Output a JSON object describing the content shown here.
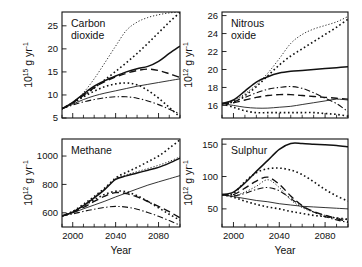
{
  "figure": {
    "shared_xlabel": "Year",
    "xticks": [
      2000,
      2040,
      2080
    ],
    "xtick_labels": [
      "2000",
      "2040",
      "2080"
    ],
    "xlim": [
      1990,
      2100
    ],
    "xminor_step": 10
  },
  "chart_data": [
    {
      "id": "carbon-dioxide",
      "type": "line",
      "title": "Carbon dioxide",
      "title_line1": "Carbon",
      "title_line2": "dioxide",
      "xlabel": "",
      "ylabel": "10¹⁵ g yr⁻¹",
      "ylabel_mantissa": "10",
      "ylabel_exponent": "15",
      "ylabel_unit": "g yr",
      "ylabel_unit_exponent": "-1",
      "xlim": [
        1990,
        2100
      ],
      "ylim": [
        5,
        28
      ],
      "yticks": [
        5,
        10,
        15,
        20,
        25
      ],
      "ytick_labels": [
        "5",
        "10",
        "15",
        "20",
        "25"
      ],
      "grid": false,
      "legend": "none",
      "x": [
        1990,
        2000,
        2010,
        2020,
        2030,
        2040,
        2050,
        2060,
        2070,
        2080,
        2090,
        2100
      ],
      "series": [
        {
          "name": "A1FI",
          "style": "fine-dot",
          "values": [
            7.0,
            8.4,
            10.5,
            13.5,
            17.0,
            20.6,
            24.0,
            25.8,
            26.8,
            27.4,
            27.8,
            28.0
          ]
        },
        {
          "name": "A2",
          "style": "dotted",
          "values": [
            7.0,
            8.3,
            9.8,
            11.5,
            13.3,
            15.1,
            17.0,
            19.0,
            21.2,
            23.5,
            25.8,
            27.9
          ]
        },
        {
          "name": "A1B",
          "style": "solid-thick",
          "values": [
            7.0,
            8.4,
            10.2,
            11.9,
            13.1,
            14.1,
            15.0,
            15.7,
            16.2,
            17.3,
            19.0,
            20.6
          ]
        },
        {
          "name": "B2",
          "style": "dashed",
          "values": [
            7.0,
            8.3,
            9.9,
            11.6,
            12.9,
            13.9,
            14.7,
            15.3,
            15.6,
            15.3,
            14.6,
            13.8
          ]
        },
        {
          "name": "B1",
          "style": "solid-thin",
          "values": [
            7.0,
            8.0,
            9.0,
            9.8,
            10.4,
            10.9,
            11.4,
            11.9,
            12.3,
            12.7,
            13.1,
            13.5
          ]
        },
        {
          "name": "A1T",
          "style": "dotted",
          "values": [
            7.0,
            8.2,
            9.6,
            10.8,
            11.8,
            12.4,
            12.6,
            12.2,
            11.0,
            9.3,
            7.3,
            5.2
          ]
        },
        {
          "name": "B1T",
          "style": "dashdot",
          "values": [
            7.0,
            7.8,
            8.5,
            9.0,
            9.4,
            9.6,
            9.6,
            9.3,
            8.7,
            7.9,
            6.9,
            5.9
          ]
        }
      ]
    },
    {
      "id": "nitrous-oxide",
      "type": "line",
      "title": "Nitrous oxide",
      "title_line1": "Nitrous",
      "title_line2": "oxide",
      "xlabel": "",
      "ylabel": "10¹² g yr⁻¹",
      "ylabel_mantissa": "10",
      "ylabel_exponent": "12",
      "ylabel_unit": "g yr",
      "ylabel_unit_exponent": "-1",
      "xlim": [
        1990,
        2100
      ],
      "ylim": [
        14.6,
        26.4
      ],
      "yticks": [
        16,
        18,
        20,
        22,
        24,
        26
      ],
      "ytick_labels": [
        "16",
        "18",
        "20",
        "22",
        "24",
        "26"
      ],
      "grid": false,
      "legend": "none",
      "x": [
        1990,
        2000,
        2010,
        2020,
        2030,
        2040,
        2050,
        2060,
        2070,
        2080,
        2090,
        2100
      ],
      "series": [
        {
          "name": "A2",
          "style": "fine-dot",
          "values": [
            16.2,
            16.5,
            17.3,
            18.3,
            19.6,
            21.2,
            22.9,
            23.9,
            24.5,
            24.9,
            25.3,
            25.9
          ]
        },
        {
          "name": "A1FI",
          "style": "dotted",
          "values": [
            16.2,
            16.4,
            17.1,
            18.1,
            19.3,
            20.5,
            21.5,
            22.3,
            23.1,
            23.9,
            24.7,
            25.6
          ]
        },
        {
          "name": "A1B",
          "style": "solid-thick",
          "values": [
            16.2,
            16.6,
            17.6,
            18.6,
            19.2,
            19.6,
            19.8,
            19.9,
            20.0,
            20.1,
            20.2,
            20.3
          ]
        },
        {
          "name": "B2",
          "style": "dashdot",
          "values": [
            16.2,
            16.4,
            16.9,
            17.4,
            17.8,
            18.0,
            18.1,
            17.9,
            17.4,
            16.8,
            16.2,
            15.3
          ]
        },
        {
          "name": "B1",
          "style": "dashed",
          "values": [
            16.2,
            16.3,
            16.6,
            16.9,
            17.1,
            17.2,
            17.2,
            17.1,
            17.0,
            16.9,
            16.8,
            16.7
          ]
        },
        {
          "name": "A1T",
          "style": "solid-thin",
          "values": [
            16.2,
            16.0,
            15.8,
            15.7,
            15.7,
            15.8,
            15.9,
            16.1,
            16.3,
            16.5,
            16.7,
            16.6
          ]
        },
        {
          "name": "B1T",
          "style": "dotted",
          "values": [
            16.2,
            15.8,
            15.4,
            15.2,
            15.2,
            15.2,
            15.2,
            15.2,
            15.2,
            15.1,
            15.0,
            14.8
          ]
        }
      ]
    },
    {
      "id": "methane",
      "type": "line",
      "title": "Methane",
      "title_line1": "Methane",
      "title_line2": "",
      "xlabel": "Year",
      "ylabel": "10¹² g yr⁻¹",
      "ylabel_mantissa": "10",
      "ylabel_exponent": "12",
      "ylabel_unit": "g yr",
      "ylabel_unit_exponent": "-1",
      "xlim": [
        1990,
        2100
      ],
      "ylim": [
        500,
        1120
      ],
      "yticks": [
        600,
        800,
        1000
      ],
      "ytick_labels": [
        "600",
        "800",
        "1000"
      ],
      "grid": false,
      "legend": "none",
      "x": [
        1990,
        2000,
        2010,
        2020,
        2030,
        2040,
        2050,
        2060,
        2070,
        2080,
        2090,
        2100
      ],
      "series": [
        {
          "name": "A1FI",
          "style": "dotted",
          "values": [
            578,
            610,
            660,
            715,
            775,
            845,
            885,
            920,
            960,
            1000,
            1055,
            1115
          ]
        },
        {
          "name": "A2",
          "style": "fine-dot",
          "values": [
            578,
            608,
            655,
            712,
            772,
            840,
            868,
            890,
            912,
            935,
            962,
            995
          ]
        },
        {
          "name": "A1B",
          "style": "solid-thick",
          "values": [
            578,
            605,
            650,
            705,
            765,
            835,
            860,
            880,
            900,
            920,
            950,
            985
          ]
        },
        {
          "name": "B2",
          "style": "solid-thin",
          "values": [
            578,
            600,
            628,
            655,
            682,
            712,
            740,
            768,
            795,
            818,
            840,
            862
          ]
        },
        {
          "name": "B1",
          "style": "dotted",
          "values": [
            578,
            608,
            648,
            692,
            730,
            752,
            748,
            720,
            680,
            635,
            590,
            548
          ]
        },
        {
          "name": "A1T",
          "style": "dashed",
          "values": [
            578,
            602,
            638,
            680,
            718,
            742,
            735,
            712,
            680,
            645,
            608,
            565
          ]
        },
        {
          "name": "B1T",
          "style": "dashdot",
          "values": [
            578,
            592,
            610,
            625,
            638,
            645,
            640,
            625,
            602,
            575,
            545,
            512
          ]
        }
      ]
    },
    {
      "id": "sulphur",
      "type": "line",
      "title": "Sulphur",
      "title_line1": "Sulphur",
      "title_line2": "",
      "xlabel": "Year",
      "ylabel": "10¹² g yr⁻¹",
      "ylabel_mantissa": "10",
      "ylabel_exponent": "12",
      "ylabel_unit": "g yr",
      "ylabel_unit_exponent": "-1",
      "xlim": [
        1990,
        2100
      ],
      "ylim": [
        22,
        158
      ],
      "yticks": [
        50,
        100,
        150
      ],
      "ytick_labels": [
        "50",
        "100",
        "150"
      ],
      "grid": false,
      "legend": "none",
      "x": [
        1990,
        2000,
        2010,
        2020,
        2030,
        2040,
        2050,
        2060,
        2070,
        2080,
        2090,
        2100
      ],
      "series": [
        {
          "name": "A1FI",
          "style": "solid-thick",
          "values": [
            72,
            76,
            90,
            108,
            125,
            142,
            151,
            151,
            150,
            149,
            148,
            146
          ]
        },
        {
          "name": "A2",
          "style": "dotted",
          "values": [
            72,
            74,
            92,
            106,
            112,
            113,
            110,
            103,
            92,
            80,
            70,
            62
          ]
        },
        {
          "name": "B2",
          "style": "dashed",
          "values": [
            72,
            72,
            82,
            93,
            99,
            88,
            70,
            55,
            46,
            40,
            35,
            30
          ]
        },
        {
          "name": "B1",
          "style": "fine-dot",
          "values": [
            72,
            70,
            76,
            85,
            95,
            83,
            64,
            52,
            45,
            40,
            36,
            33
          ]
        },
        {
          "name": "A1B",
          "style": "dashdot",
          "values": [
            72,
            70,
            74,
            80,
            83,
            78,
            66,
            54,
            45,
            38,
            33,
            29
          ]
        },
        {
          "name": "A1T",
          "style": "solid-thin",
          "values": [
            72,
            69,
            66,
            63,
            61,
            58,
            56,
            54,
            53,
            52,
            51,
            50
          ]
        },
        {
          "name": "B1T",
          "style": "dotted",
          "values": [
            72,
            68,
            62,
            57,
            53,
            50,
            46,
            43,
            40,
            38,
            36,
            34
          ]
        }
      ]
    }
  ]
}
